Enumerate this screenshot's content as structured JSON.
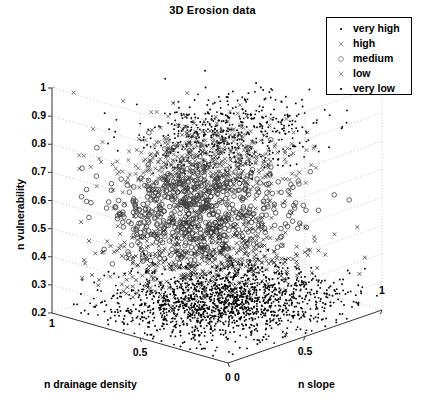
{
  "chart_data": {
    "type": "scatter",
    "title": "3D  Erosion data",
    "projection": "3d",
    "xlabel": "n drainage density",
    "zlabel": "n slope",
    "ylabel": "n vulnerability",
    "xlim": [
      1,
      0
    ],
    "zlim": [
      0,
      1
    ],
    "ylim": [
      0.2,
      1
    ],
    "x_ticks": [
      "1",
      "0.5",
      "0"
    ],
    "x_tick_values": [
      1,
      0.5,
      0
    ],
    "z_ticks": [
      "0",
      "0.5",
      "1"
    ],
    "z_tick_values": [
      0,
      0.5,
      1
    ],
    "y_ticks": [
      "0.2",
      "0.3",
      "0.4",
      "0.5",
      "0.6",
      "0.7",
      "0.8",
      "0.9",
      "1"
    ],
    "y_tick_values": [
      0.2,
      0.3,
      0.4,
      0.5,
      0.6,
      0.7,
      0.8,
      0.9,
      1
    ],
    "grid": true,
    "legend_position": "top-right",
    "series": [
      {
        "name": "very high",
        "marker": "dot",
        "count": 520,
        "x_center": 0.42,
        "x_spread": 0.17,
        "z_center": 0.46,
        "z_spread": 0.2,
        "y_center": 0.855,
        "y_spread": 0.055,
        "color": "#000000",
        "seed": 11
      },
      {
        "name": "high",
        "marker": "x",
        "count": 560,
        "x_center": 0.5,
        "x_spread": 0.18,
        "z_center": 0.4,
        "z_spread": 0.2,
        "y_center": 0.735,
        "y_spread": 0.06,
        "color": "#4a4a4a",
        "seed": 23
      },
      {
        "name": "medium",
        "marker": "circle",
        "count": 620,
        "x_center": 0.52,
        "x_spread": 0.19,
        "z_center": 0.4,
        "z_spread": 0.22,
        "y_center": 0.57,
        "y_spread": 0.075,
        "color": "#3d3d3d",
        "seed": 37
      },
      {
        "name": "low",
        "marker": "x",
        "count": 520,
        "x_center": 0.5,
        "x_spread": 0.2,
        "z_center": 0.44,
        "z_spread": 0.23,
        "y_center": 0.4,
        "y_spread": 0.06,
        "color": "#2b2b2b",
        "seed": 53
      },
      {
        "name": "very low",
        "marker": "dot",
        "count": 1500,
        "x_center": 0.45,
        "x_spread": 0.22,
        "z_center": 0.5,
        "z_spread": 0.27,
        "y_center": 0.245,
        "y_spread": 0.03,
        "color": "#000000",
        "seed": 71
      }
    ],
    "outliers": [
      {
        "marker": "x",
        "x": 0.93,
        "z": 0.06,
        "y": 0.985
      },
      {
        "marker": "dot",
        "x": 0.8,
        "z": 0.07,
        "y": 0.215
      }
    ]
  },
  "legend": {
    "entries": [
      {
        "label": "very high",
        "marker": "dot"
      },
      {
        "label": "high",
        "marker": "x"
      },
      {
        "label": "medium",
        "marker": "circle"
      },
      {
        "label": "low",
        "marker": "x"
      },
      {
        "label": "very low",
        "marker": "dot"
      }
    ]
  },
  "geometry": {
    "origin": [
      228,
      363
    ],
    "left_front": [
      52,
      313
    ],
    "right_front": [
      382,
      310
    ],
    "back": [
      228,
      289
    ],
    "y_top": 88,
    "y_bottom": 313
  }
}
